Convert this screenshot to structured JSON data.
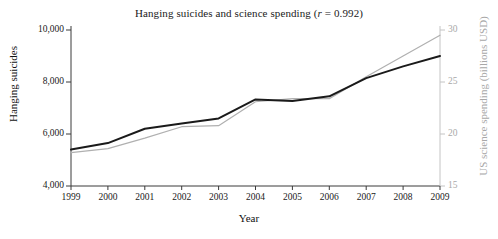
{
  "chart_data": {
    "type": "line",
    "title": "Hanging suicides and science spending (r = 0.992)",
    "title_prefix": "Hanging suicides and science spending (",
    "title_italic": "r",
    "title_suffix": " = 0.992)",
    "correlation": 0.992,
    "xlabel": "Year",
    "ylabel": "Hanging suicides",
    "y2label": "US science spending (billions USD)",
    "x": [
      1999,
      2000,
      2001,
      2002,
      2003,
      2004,
      2005,
      2006,
      2007,
      2008,
      2009
    ],
    "categories": [
      "1999",
      "2000",
      "2001",
      "2002",
      "2003",
      "2004",
      "2005",
      "2006",
      "2007",
      "2008",
      "2009"
    ],
    "xlim": [
      1999,
      2009
    ],
    "ylim": [
      4000,
      10000
    ],
    "y2lim": [
      15,
      30
    ],
    "yticks": [
      4000,
      6000,
      8000,
      10000
    ],
    "ytick_labels": [
      "4,000",
      "6,000",
      "8,000",
      "10,000"
    ],
    "y2ticks": [
      15,
      20,
      25,
      30
    ],
    "y2tick_labels": [
      "15",
      "20",
      "25",
      "30"
    ],
    "grid": false,
    "legend": "none",
    "series": [
      {
        "name": "Hanging suicides",
        "axis": "left",
        "color": "#1a1a1a",
        "linewidth": 2.0,
        "values": [
          5400,
          5650,
          6200,
          6400,
          6600,
          7330,
          7270,
          7450,
          8150,
          8600,
          9000
        ]
      },
      {
        "name": "US science spending (billions USD)",
        "axis": "right",
        "color": "#b0b0b0",
        "linewidth": 1.2,
        "values": [
          18.2,
          18.6,
          19.6,
          20.7,
          20.8,
          23.1,
          23.4,
          23.4,
          25.5,
          27.5,
          29.5
        ]
      }
    ]
  },
  "colors": {
    "left_axis": "#3a3a3a",
    "right_axis": "#c4c4c4",
    "background": "#ffffff",
    "series_black": "#1a1a1a",
    "series_gray": "#b0b0b0"
  }
}
